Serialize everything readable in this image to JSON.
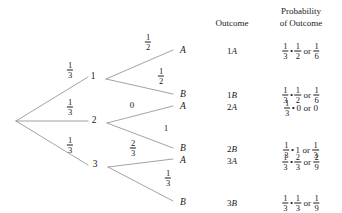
{
  "diagram": {
    "type": "probability-tree",
    "title": "",
    "headers": {
      "outcome": "Outcome",
      "probability_line1": "Probability",
      "probability_line2": "of Outcome"
    },
    "root": {
      "label": "",
      "x": 16,
      "y": 121
    },
    "stage1": {
      "edge_labels": [
        {
          "num": "1",
          "den": "3"
        },
        {
          "num": "1",
          "den": "3"
        },
        {
          "num": "1",
          "den": "3"
        }
      ],
      "nodes": [
        "1",
        "2",
        "3"
      ]
    },
    "stage2": {
      "edge_labels": [
        {
          "num": "1",
          "den": "2"
        },
        {
          "num": "1",
          "den": "2"
        },
        {
          "whole": "0"
        },
        {
          "whole": "1"
        },
        {
          "num": "2",
          "den": "3"
        },
        {
          "num": "1",
          "den": "3"
        }
      ],
      "nodes": [
        "A",
        "B",
        "A",
        "B",
        "A",
        "B"
      ]
    },
    "outcomes": [
      {
        "digit": "1",
        "letter": "A"
      },
      {
        "digit": "1",
        "letter": "B"
      },
      {
        "digit": "2",
        "letter": "A"
      },
      {
        "digit": "2",
        "letter": "B"
      },
      {
        "digit": "3",
        "letter": "A"
      },
      {
        "digit": "3",
        "letter": "B"
      }
    ],
    "probabilities": [
      {
        "first": {
          "num": "1",
          "den": "3"
        },
        "operator": "•",
        "second": {
          "num": "1",
          "den": "2"
        },
        "connector": "or",
        "result": {
          "num": "1",
          "den": "6"
        }
      },
      {
        "first": {
          "num": "1",
          "den": "3"
        },
        "operator": "•",
        "second": {
          "num": "1",
          "den": "2"
        },
        "connector": "or",
        "result": {
          "num": "1",
          "den": "6"
        }
      },
      {
        "first": {
          "num": "1",
          "den": "3"
        },
        "operator": "•",
        "second": {
          "whole": "0"
        },
        "connector": "or",
        "result": {
          "whole": "0"
        }
      },
      {
        "first": {
          "num": "1",
          "den": "3"
        },
        "operator": "•",
        "second": {
          "whole": "1"
        },
        "connector": "or",
        "result": {
          "num": "1",
          "den": "3"
        }
      },
      {
        "first": {
          "num": "1",
          "den": "3"
        },
        "operator": "•",
        "second": {
          "num": "2",
          "den": "3"
        },
        "connector": "or",
        "result": {
          "num": "2",
          "den": "9"
        }
      },
      {
        "first": {
          "num": "1",
          "den": "3"
        },
        "operator": "•",
        "second": {
          "num": "1",
          "den": "3"
        },
        "connector": "or",
        "result": {
          "num": "1",
          "den": "9"
        }
      }
    ],
    "colors": {
      "line": "#8c8c8c",
      "text": "#1a1a1a",
      "background": "#ffffff"
    }
  }
}
